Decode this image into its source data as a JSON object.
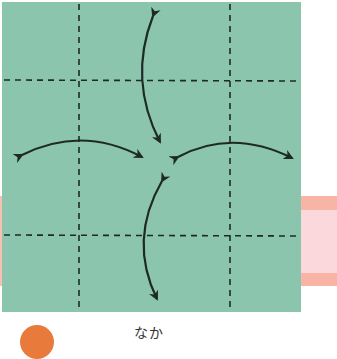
{
  "diagram": {
    "type": "origami-fold-step",
    "paper_color": "#8cc5ae",
    "line_color": "#1e2a26",
    "square": {
      "x": 2,
      "y": 2,
      "w": 299,
      "h": 310
    },
    "fold_lines": {
      "vertical_x": [
        79,
        230
      ],
      "horizontal_y": [
        80,
        235
      ],
      "style": "dashed"
    },
    "arrows": [
      {
        "name": "top",
        "from": [
          153,
          16
        ],
        "to": [
          160,
          142
        ],
        "bulge": "left"
      },
      {
        "name": "left",
        "from": [
          22,
          155
        ],
        "to": [
          142,
          157
        ],
        "bulge": "up"
      },
      {
        "name": "right",
        "from": [
          178,
          157
        ],
        "to": [
          292,
          158
        ],
        "bulge": "up"
      },
      {
        "name": "bottom",
        "from": [
          162,
          181
        ],
        "to": [
          157,
          299
        ],
        "bulge": "left"
      }
    ]
  },
  "background_band": {
    "color_outer": "#f8b5a5",
    "color_inner": "#fad8dc"
  },
  "caption": {
    "text": "なか"
  },
  "marker": {
    "color": "#e87a3c"
  }
}
